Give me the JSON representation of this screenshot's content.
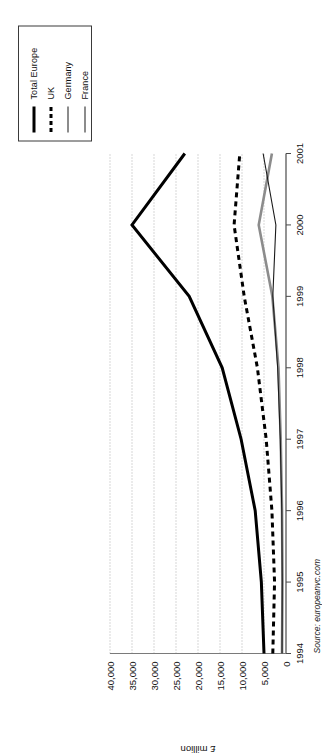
{
  "chart_data": {
    "type": "line",
    "title": "",
    "xlabel": "",
    "ylabel": "£ million",
    "categories": [
      "1994",
      "1995",
      "1996",
      "1997",
      "1998",
      "1999",
      "2000",
      "2001"
    ],
    "x": [
      1994,
      1995,
      1996,
      1997,
      1998,
      1999,
      2000,
      2001
    ],
    "ylim": [
      0,
      40000
    ],
    "ytick_values": [
      0,
      5000,
      10000,
      15000,
      20000,
      25000,
      30000,
      35000,
      40000
    ],
    "ytick_labels": [
      "0",
      "5,000",
      "10,000",
      "15,000",
      "20,000",
      "25,000",
      "30,000",
      "35,000",
      "40,000"
    ],
    "grid": true,
    "grid_style": "dotted-vertical-on-value-axis",
    "legend_position": "top-right-boxed",
    "series": [
      {
        "name": "Total Europe",
        "color": "#000000",
        "style": "solid",
        "width": 3,
        "values": [
          5000,
          5600,
          7000,
          10200,
          14500,
          22000,
          35000,
          23000
        ]
      },
      {
        "name": "UK",
        "color": "#000000",
        "style": "dashed",
        "width": 3,
        "values": [
          3000,
          2600,
          3200,
          4500,
          6500,
          9500,
          11800,
          10500
        ]
      },
      {
        "name": "Germany",
        "color": "#8c8c8c",
        "style": "solid",
        "width": 2.6,
        "values": [
          900,
          800,
          900,
          1200,
          1700,
          3100,
          6200,
          3200
        ]
      },
      {
        "name": "France",
        "color": "#1a1a1a",
        "style": "solid",
        "width": 1.1,
        "values": [
          900,
          850,
          950,
          1300,
          1900,
          3000,
          2300,
          5200
        ]
      }
    ],
    "source": "Source: europeanvc.com"
  },
  "legend": {
    "items": [
      {
        "label": "Total Europe",
        "swatch": "solid-thick-black"
      },
      {
        "label": "UK",
        "swatch": "dashed-thick-black"
      },
      {
        "label": "Germany",
        "swatch": "solid-gray"
      },
      {
        "label": "France",
        "swatch": "solid-thin-black"
      }
    ]
  }
}
